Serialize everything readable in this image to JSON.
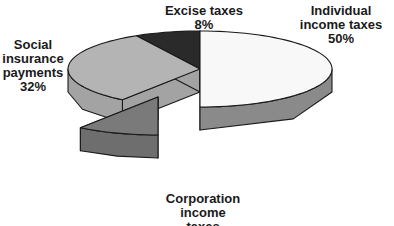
{
  "chart_data": {
    "type": "pie",
    "style": "3d-exploded",
    "title": "",
    "slices": [
      {
        "label": "Individual income taxes",
        "value": 50,
        "value_label": "50%",
        "color": "#f8f8f8",
        "side_color": "#8a8a8a",
        "exploded": false
      },
      {
        "label": "Corporation income taxes",
        "value": 10,
        "value_label": "10%",
        "color": "#7a7a7a",
        "side_color": "#6e6e6e",
        "exploded": true
      },
      {
        "label": "Social insurance payments",
        "value": 32,
        "value_label": "32%",
        "color": "#b4b4b4",
        "side_color": "#a3a3a3",
        "exploded": false
      },
      {
        "label": "Excise taxes",
        "value": 8,
        "value_label": "8%",
        "color": "#2a2a2a",
        "side_color": "#1e1e1e",
        "exploded": false
      }
    ],
    "label_lines": [
      "Individual\nincome taxes\n50%",
      "Corporation\nincome\ntaxes\n10%",
      "Social\ninsurance\npayments\n32%",
      "Excise taxes\n8%"
    ],
    "start_angle": "12 o'clock",
    "direction": "clockwise",
    "legend": "none"
  }
}
